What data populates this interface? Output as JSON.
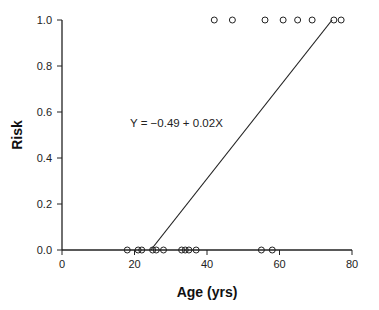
{
  "chart_data": {
    "type": "scatter",
    "title": "",
    "xlabel": "Age (yrs)",
    "ylabel": "Risk",
    "xlim": [
      0,
      80
    ],
    "ylim": [
      0,
      1
    ],
    "x_ticks": [
      0,
      20,
      40,
      60,
      80
    ],
    "y_ticks": [
      0.0,
      0.2,
      0.4,
      0.6,
      0.8,
      1.0
    ],
    "x_tick_labels": [
      "0",
      "20",
      "40",
      "60",
      "80"
    ],
    "y_tick_labels": [
      "0.0",
      "0.2",
      "0.4",
      "0.6",
      "0.8",
      "1.0"
    ],
    "grid": false,
    "legend": null,
    "series": [
      {
        "name": "Risk = 0",
        "marker": "open-circle",
        "points": [
          {
            "x": 18,
            "y": 0
          },
          {
            "x": 21,
            "y": 0
          },
          {
            "x": 22,
            "y": 0
          },
          {
            "x": 25,
            "y": 0
          },
          {
            "x": 26,
            "y": 0
          },
          {
            "x": 28,
            "y": 0
          },
          {
            "x": 33,
            "y": 0
          },
          {
            "x": 34,
            "y": 0
          },
          {
            "x": 35,
            "y": 0
          },
          {
            "x": 37,
            "y": 0
          },
          {
            "x": 55,
            "y": 0
          },
          {
            "x": 58,
            "y": 0
          }
        ]
      },
      {
        "name": "Risk = 1",
        "marker": "open-circle",
        "points": [
          {
            "x": 42,
            "y": 1
          },
          {
            "x": 47,
            "y": 1
          },
          {
            "x": 56,
            "y": 1
          },
          {
            "x": 61,
            "y": 1
          },
          {
            "x": 65,
            "y": 1
          },
          {
            "x": 69,
            "y": 1
          },
          {
            "x": 75,
            "y": 1
          },
          {
            "x": 77,
            "y": 1
          }
        ]
      }
    ],
    "fit_line": {
      "equation": "Y = -0.49 + 0.02X",
      "intercept": -0.49,
      "slope": 0.02,
      "x_range": [
        24.5,
        74.5
      ]
    },
    "annotations": [
      {
        "text": "Y = -0.49 + 0.02X",
        "x": 26,
        "y": 0.56
      }
    ]
  },
  "labels": {
    "xlabel": "Age (yrs)",
    "ylabel": "Risk",
    "equation": "Y  =  −0.49  +  0.02X"
  }
}
